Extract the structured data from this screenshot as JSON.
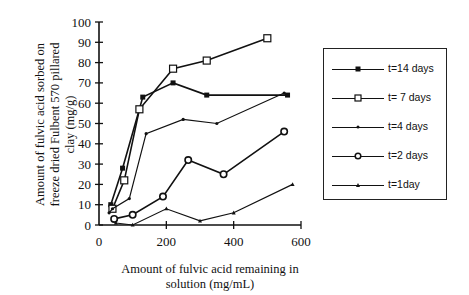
{
  "chart_data": {
    "type": "line",
    "title": "",
    "xlabel": "Amount of fulvic acid remaining in solution (mg/mL)",
    "xlabel_lines": [
      "Amount of fulvic acid remaining in",
      "solution (mg/mL)"
    ],
    "ylabel": "Amount of fulvic acid sorbed on freeze dried Fulbent 570 pillared clay (mg/g)",
    "ylabel_lines": [
      "Amount of fulvic acid sorbed on",
      "freeze dried Fulbent 570 pillared",
      "clay (mg/g)"
    ],
    "xlim": [
      0,
      600
    ],
    "ylim": [
      0,
      100
    ],
    "xticks": [
      0,
      200,
      400,
      600
    ],
    "yticks": [
      0,
      10,
      20,
      30,
      40,
      50,
      60,
      70,
      80,
      90,
      100
    ],
    "grid": false,
    "legend_position": "right",
    "series": [
      {
        "name": "t=14 days",
        "marker": "filled-square",
        "x": [
          35,
          70,
          130,
          220,
          320,
          560
        ],
        "y": [
          10,
          28,
          63,
          70,
          64,
          64
        ]
      },
      {
        "name": "t= 7 days",
        "marker": "open-square",
        "x": [
          40,
          75,
          120,
          220,
          320,
          500
        ],
        "y": [
          8,
          22,
          57,
          77,
          81,
          92
        ]
      },
      {
        "name": "t=4 days",
        "marker": "dot",
        "x": [
          30,
          40,
          90,
          140,
          250,
          350,
          550
        ],
        "y": [
          6,
          8,
          13,
          45,
          52,
          50,
          65
        ]
      },
      {
        "name": "t=2 days",
        "marker": "open-circle",
        "x": [
          45,
          100,
          190,
          265,
          370,
          550
        ],
        "y": [
          3,
          5,
          14,
          32,
          25,
          46
        ]
      },
      {
        "name": "t=1day",
        "marker": "small-triangle",
        "x": [
          50,
          100,
          200,
          300,
          400,
          575
        ],
        "y": [
          1,
          0,
          8,
          2,
          6,
          20
        ]
      }
    ]
  },
  "legend": {
    "items": [
      {
        "label": "t=14 days",
        "marker": "filled-square"
      },
      {
        "label": "t= 7 days",
        "marker": "open-square"
      },
      {
        "label": "t=4 days",
        "marker": "dot"
      },
      {
        "label": "t=2 days",
        "marker": "open-circle"
      },
      {
        "label": "t=1day",
        "marker": "small-triangle"
      }
    ]
  },
  "axes": {
    "x_tick_labels": [
      "0",
      "200",
      "400",
      "600"
    ],
    "y_tick_labels": [
      "0",
      "10",
      "20",
      "30",
      "40",
      "50",
      "60",
      "70",
      "80",
      "90",
      "100"
    ]
  }
}
